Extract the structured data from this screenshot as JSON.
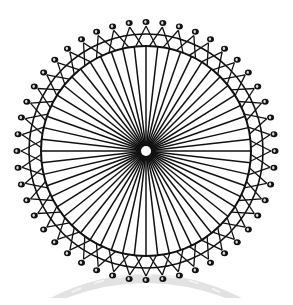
{
  "illustration": {
    "title": "Ferris wheel",
    "description": "Black line-art Ferris wheel with radial spokes, double rim with lattice, passenger pods around the rim and a grey arched shadow below"
  },
  "geometry": {
    "center": [
      146,
      151
    ],
    "hub_inner_radius": 5,
    "hub_outer_radius": 10,
    "inner_ring_radius": 105,
    "outer_ring_radius": 117,
    "pod_radius": 129,
    "pod_count": 48,
    "spoke_count": 56,
    "pod_size": [
      7,
      6
    ]
  },
  "colors": {
    "background": "#ffffff",
    "line": "#111111",
    "pod": "#111111",
    "pod_highlight": "#ffffff",
    "hub_center": "#ffffff",
    "shadow": "#e2e2e2",
    "shadow_dash": "#f6f6f6"
  },
  "shadow": {
    "left": [
      50,
      298
    ],
    "right": [
      242,
      298
    ],
    "peak_outer_y": 272,
    "peak_inner_y": 286
  }
}
